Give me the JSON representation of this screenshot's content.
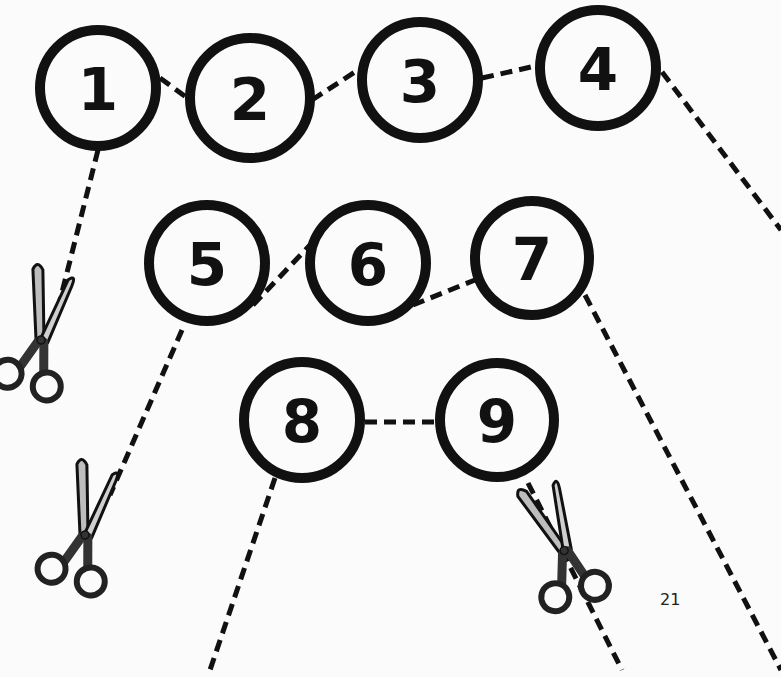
{
  "worksheet": {
    "circles": [
      {
        "label": "1"
      },
      {
        "label": "2"
      },
      {
        "label": "3"
      },
      {
        "label": "4"
      },
      {
        "label": "5"
      },
      {
        "label": "6"
      },
      {
        "label": "7"
      },
      {
        "label": "8"
      },
      {
        "label": "9"
      }
    ],
    "icons": [
      "scissors-icon",
      "scissors-icon",
      "scissors-icon"
    ],
    "page_number": "21"
  }
}
